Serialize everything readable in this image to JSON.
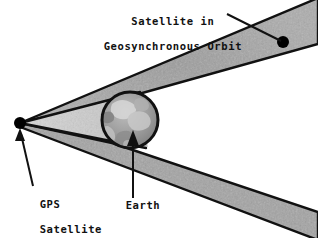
{
  "figure": {
    "kind": "schematic-diagram",
    "background_color": "#FFFFFF",
    "beam_fill_color": "#A3A3A3",
    "cone_fill_color": "#C9C9C9",
    "outline_color": "#111111",
    "earth_fill_color": "#9A9A9A",
    "marker_color": "#000000"
  },
  "labels": {
    "title_line1": "Satellite in",
    "title_line2": "Geosynchronous Orbit",
    "title_full": "Satellite in Geosynchronous Orbit",
    "gps_line1": "GPS",
    "gps_line2": "Satellite",
    "gps_full": "GPS Satellite",
    "earth": "Earth"
  },
  "markers": {
    "gps_satellite": {
      "name": "GPS Satellite",
      "x": 20,
      "y": 123,
      "radius": 6
    },
    "geo_satellite": {
      "name": "Satellite in Geosynchronous Orbit",
      "x": 283,
      "y": 42,
      "radius": 6
    },
    "earth": {
      "name": "Earth",
      "cx": 130,
      "cy": 120,
      "radius": 28
    }
  },
  "leader_lines": {
    "geo_satellite_callout": "from title text down-right to geosynchronous satellite dot",
    "gps_satellite_callout": "from GPS Satellite text up-left with arrowhead at GPS dot",
    "earth_callout": "from Earth text straight up with arrowhead into Earth disc"
  }
}
